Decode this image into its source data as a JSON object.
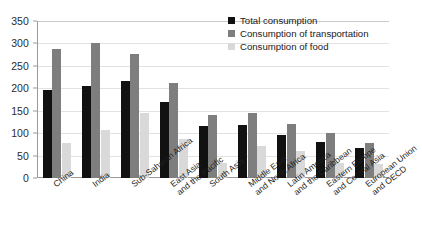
{
  "chart_data": {
    "type": "bar",
    "title": "",
    "subtitle": "",
    "xlabel": "",
    "ylabel": "",
    "ylim": [
      0,
      350
    ],
    "ytick_values": [
      0,
      50,
      100,
      150,
      200,
      250,
      300,
      350
    ],
    "ytick_labels": [
      "0",
      "50",
      "100",
      "150",
      "200",
      "250",
      "300",
      "350"
    ],
    "grid": true,
    "legend_position": "top-right",
    "categories": [
      "China",
      "India",
      "Sub-Saharan Africa",
      "East Asia and the Pacific",
      "South Asia",
      "Middle East and North Africa",
      "Latin America and the Caribbean",
      "Eastern Europe and Central Asia",
      "European Union and OECD"
    ],
    "category_lines": [
      [
        "China",
        ""
      ],
      [
        "India",
        ""
      ],
      [
        "Sub-Saharan Africa",
        ""
      ],
      [
        "East Asia",
        "and the Pacific"
      ],
      [
        "South Asia",
        ""
      ],
      [
        "Middle East",
        "and North Africa"
      ],
      [
        "Latin America",
        "and the Caribbean"
      ],
      [
        "Eastern Europe",
        "and Central Asia"
      ],
      [
        "European Union",
        "and OECD"
      ]
    ],
    "series": [
      {
        "name": "Total consumption",
        "color": "#111111",
        "values": [
          197,
          206,
          216,
          170,
          117,
          119,
          96,
          80,
          68
        ]
      },
      {
        "name": "Consumption of transportation",
        "color": "#7e7e7e",
        "values": [
          288,
          300,
          276,
          212,
          140,
          146,
          121,
          100,
          78
        ]
      },
      {
        "name": "Consumption of food",
        "color": "#d9d9d9",
        "values": [
          78,
          106,
          146,
          86,
          33,
          71,
          61,
          33,
          32
        ]
      }
    ]
  }
}
